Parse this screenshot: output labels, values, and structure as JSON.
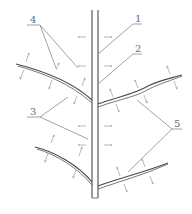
{
  "diagram": {
    "type": "leaf venation / branching stem schematic",
    "labels": [
      {
        "id": "1",
        "text": "1",
        "x": 135,
        "y": 22
      },
      {
        "id": "2",
        "text": "2",
        "x": 135,
        "y": 52
      },
      {
        "id": "3",
        "text": "3",
        "x": 33,
        "y": 113
      },
      {
        "id": "4",
        "text": "4",
        "x": 33,
        "y": 23
      },
      {
        "id": "5",
        "text": "5",
        "x": 174,
        "y": 128
      }
    ],
    "colors": {
      "background": "#ffffff",
      "line": "#6a6a6a",
      "branch": "#4a4a4a",
      "arrow": "#8a8a8a"
    }
  }
}
